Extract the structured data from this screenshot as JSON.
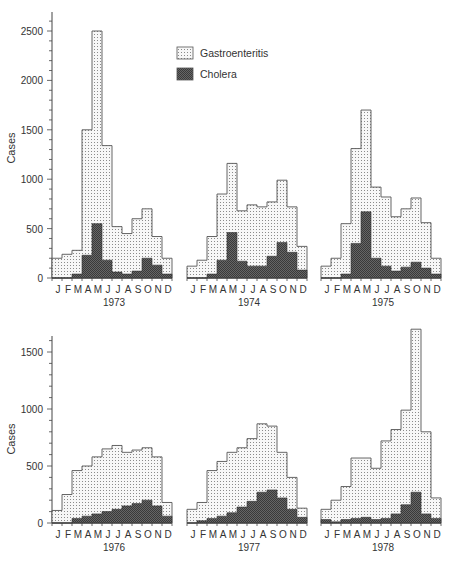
{
  "chart_data": {
    "type": "bar",
    "title": "",
    "months": [
      "J",
      "F",
      "M",
      "A",
      "M",
      "J",
      "J",
      "A",
      "S",
      "O",
      "N",
      "D"
    ],
    "ylabel": "Cases",
    "legend": [
      {
        "name": "Gastroenteritis",
        "pattern": "dotted",
        "color": "#f3f3f3"
      },
      {
        "name": "Cholera",
        "pattern": "dark-crosshatch",
        "color": "#555555"
      }
    ],
    "panels": [
      {
        "year": "1973",
        "row": 0,
        "series": [
          {
            "name": "Gastroenteritis",
            "values": [
              200,
              240,
              280,
              1500,
              2500,
              1340,
              520,
              450,
              600,
              700,
              420,
              200
            ]
          },
          {
            "name": "Cholera",
            "values": [
              0,
              0,
              40,
              230,
              550,
              180,
              60,
              40,
              70,
              200,
              130,
              40
            ]
          }
        ]
      },
      {
        "year": "1974",
        "row": 0,
        "series": [
          {
            "name": "Gastroenteritis",
            "values": [
              120,
              180,
              420,
              850,
              1160,
              680,
              740,
              720,
              770,
              990,
              720,
              320
            ]
          },
          {
            "name": "Cholera",
            "values": [
              0,
              0,
              40,
              180,
              460,
              170,
              120,
              120,
              220,
              360,
              260,
              80
            ]
          }
        ]
      },
      {
        "year": "1975",
        "row": 0,
        "series": [
          {
            "name": "Gastroenteritis",
            "values": [
              120,
              200,
              550,
              1310,
              1700,
              920,
              820,
              620,
              700,
              810,
              560,
              200
            ]
          },
          {
            "name": "Cholera",
            "values": [
              0,
              0,
              40,
              350,
              670,
              200,
              120,
              70,
              110,
              160,
              100,
              40
            ]
          }
        ]
      },
      {
        "year": "1976",
        "row": 1,
        "series": [
          {
            "name": "Gastroenteritis",
            "values": [
              110,
              250,
              460,
              500,
              580,
              650,
              680,
              620,
              640,
              660,
              580,
              180
            ]
          },
          {
            "name": "Cholera",
            "values": [
              0,
              0,
              40,
              60,
              80,
              100,
              120,
              150,
              170,
              200,
              150,
              60
            ]
          }
        ]
      },
      {
        "year": "1977",
        "row": 1,
        "series": [
          {
            "name": "Gastroenteritis",
            "values": [
              120,
              180,
              460,
              540,
              620,
              660,
              740,
              870,
              850,
              620,
              400,
              130
            ]
          },
          {
            "name": "Cholera",
            "values": [
              0,
              20,
              40,
              60,
              90,
              140,
              190,
              270,
              290,
              220,
              120,
              50
            ]
          }
        ]
      },
      {
        "year": "1978",
        "row": 1,
        "series": [
          {
            "name": "Gastroenteritis",
            "values": [
              120,
              200,
              320,
              570,
              570,
              480,
              720,
              820,
              990,
              1700,
              800,
              220
            ]
          },
          {
            "name": "Cholera",
            "values": [
              30,
              10,
              30,
              40,
              50,
              30,
              40,
              80,
              160,
              270,
              80,
              40
            ]
          }
        ]
      }
    ],
    "axes": [
      {
        "row": 0,
        "ylim": [
          0,
          2700
        ],
        "yticks": [
          0,
          500,
          1000,
          1500,
          2000,
          2500
        ]
      },
      {
        "row": 1,
        "ylim": [
          0,
          1750
        ],
        "yticks": [
          0,
          500,
          1000,
          1500
        ]
      }
    ]
  },
  "labels": {
    "ylabel_top": "Cases",
    "ylabel_bottom": "Cases",
    "legend_gastro": "Gastroenteritis",
    "legend_cholera": "Cholera"
  }
}
